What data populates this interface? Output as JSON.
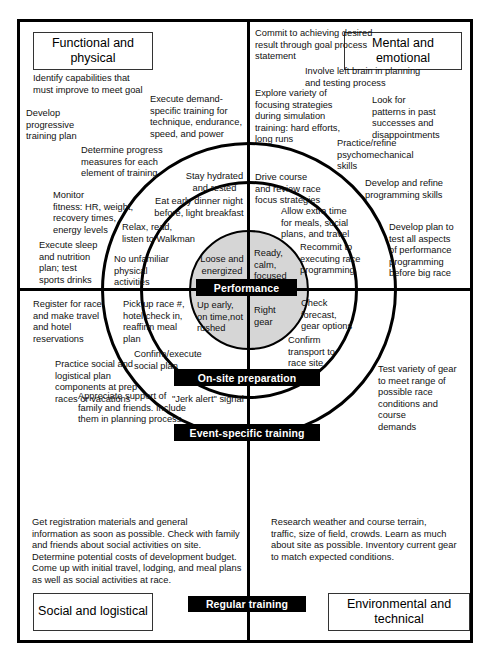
{
  "diagram": {
    "center_label": "Performance",
    "quadrants": {
      "top_left": "Functional and physical",
      "top_right": "Mental and emotional",
      "bottom_left": "Social and logistical",
      "bottom_right": "Environmental and technical"
    },
    "rings": [
      {
        "name": "Performance",
        "label": "Performance"
      },
      {
        "name": "On-site preparation",
        "label": "On-site preparation"
      },
      {
        "name": "Event-specific training",
        "label": "Event-specific training"
      },
      {
        "name": "Regular training",
        "label": "Regular training"
      }
    ],
    "colors": {
      "core_fill": "#d6d6d6",
      "line": "#000000",
      "banner_bg": "#000000",
      "banner_text": "#ffffff",
      "page_bg": "#ffffff"
    },
    "core_items": {
      "functional_physical": "Loose and\nenergized",
      "mental_emotional": "Ready,\ncalm,\nfocused",
      "social_logistical": "Up early,\non time,not\nrushed",
      "environmental_technical": "Right\ngear"
    },
    "onsite": {
      "fp_1": "Stay hydrated\nand rested",
      "fp_2": "Eat early dinner night\nbefore, light breakfast",
      "fp_3": "Relax, read,\nlisten to Walkman",
      "fp_4": "No unfamiliar\nphysical\nactivities",
      "me_1": "Drive course\nand review race\nfocus strategies",
      "me_2": "Allow extra time\nfor meals, social\nplans, and travel",
      "me_3": "Recommit to\nexecuting race\nprogramming",
      "sl_1": "Pick up race #,\nhotel check in,\nreaffirm meal\nplan",
      "sl_2": "Confirm/execute\nsocial plan",
      "et_1": "Check\nforecast,\ngear options",
      "et_2": "Confirm\ntransport to\nrace site"
    },
    "event_specific": {
      "fp_1": "Execute demand-\nspecific training for\ntechnique, endurance,\nspeed, and power",
      "fp_2": "Determine progress\nmeasures for each\nelement of training",
      "fp_3": "Monitor\nfitness: HR, weight,\nrecovery times,\nenergy levels",
      "fp_4": "Execute sleep\nand nutrition\nplan; test\nsports drinks",
      "me_1": "Explore variety of\nfocusing strategies\nduring simulation\ntraining: hard efforts,\nlong runs",
      "me_2": "Practice/refine\npsychomechanical\nskills",
      "me_3": "Develop and refine\nprogramming skills",
      "me_4": "Develop plan to\ntest all aspects\nof performance\nprogramming\nbefore big race",
      "sl_1": "Register for race\nand make travel\nand hotel\nreservations",
      "sl_2": "Practice social and\nlogistical plan\ncomponents at prep\nraces or vacations",
      "sl_3": "Appreciate support of\nfamily and friends. Include\nthem in planning process",
      "sl_4": "\"Jerk alert\" signal",
      "et_1": "Test variety of gear\nto meet range of\npossible race\nconditions and\ncourse\ndemands"
    },
    "regular_training": {
      "fp_1": "Identify capabilities that\nmust improve to meet goal",
      "fp_2": "Develop\nprogressive\ntraining plan",
      "me_1": "Commit to achieving desired\nresult through goal process\nstatement",
      "me_2": "Involve left brain in planning\nand testing process",
      "me_3": "Look for\npatterns in past\nsuccesses and\ndisappointments",
      "sl_1": "Get registration materials and general\ninformation as soon as possible. Check with family\nand friends about social activities on site.\nDetermine potential costs of development budget.\nCome up with initial travel, lodging, and meal plans\nas well as social activities at race.",
      "et_1": "Research weather and course terrain,\ntraffic, size of field, crowds. Learn as much\nabout site as possible. Inventory current gear\nto match expected conditions."
    }
  }
}
